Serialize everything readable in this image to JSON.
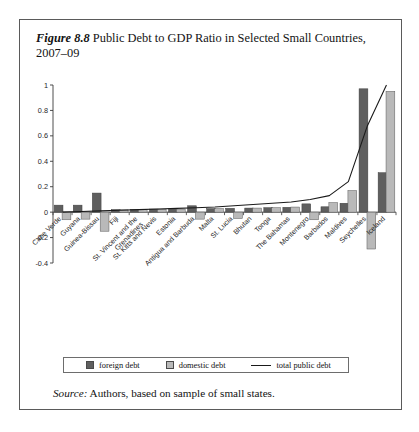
{
  "figure": {
    "number": "Figure 8.8",
    "title": " Public Debt to GDP Ratio in Selected Small Countries, 2007–09"
  },
  "source": {
    "label": "Source:",
    "text": " Authors, based on sample of small states."
  },
  "legend": {
    "position": "bottom-outside",
    "items": [
      {
        "label": "foreign debt",
        "type": "swatch",
        "color": "#5f5f5f"
      },
      {
        "label": "domestic debt",
        "type": "swatch",
        "color": "#b9b9b9"
      },
      {
        "label": "total public debt",
        "type": "line",
        "color": "#1a1a1a"
      }
    ]
  },
  "chart_data": {
    "type": "bar",
    "title": "Public Debt to GDP Ratio in Selected Small Countries, 2007–09",
    "subtitle": "",
    "xlabel": "",
    "ylabel": "",
    "ylim": [
      -0.4,
      1.0
    ],
    "yticks": [
      -0.4,
      -0.2,
      0,
      0.2,
      0.4,
      0.6,
      0.8,
      1
    ],
    "ytick_labels": [
      "-0.4",
      "-0.2",
      "0",
      "0.2",
      "0.4",
      "0.6",
      "0.8",
      "1"
    ],
    "grid": false,
    "categories": [
      "Cape Verde",
      "Guyana",
      "Guinea-Bissau",
      "Fiji",
      "St. Vincent and the Grenadines",
      "St. Kitts and Nevis",
      "Estonia",
      "Antigua and Barbuda",
      "Malta",
      "St. Lucia",
      "Bhutan",
      "Tonga",
      "The Bahamas",
      "Montenegro",
      "Barbados",
      "Maldives",
      "Seychelles",
      "Iceland"
    ],
    "series": [
      {
        "name": "foreign debt",
        "color": "#5f5f5f",
        "values": [
          0.055,
          0.055,
          0.15,
          0.02,
          0.022,
          0.024,
          0.026,
          0.05,
          0.028,
          0.03,
          0.032,
          0.035,
          0.038,
          0.065,
          0.042,
          0.07,
          0.97,
          0.31
        ]
      },
      {
        "name": "domestic debt",
        "color": "#b9b9b9",
        "values": [
          -0.06,
          -0.055,
          -0.15,
          0.018,
          0.02,
          0.022,
          0.024,
          -0.055,
          0.028,
          -0.05,
          0.032,
          0.035,
          0.04,
          -0.06,
          0.075,
          0.17,
          -0.29,
          0.95
        ]
      },
      {
        "name": "total public debt",
        "color": "#1a1a1a",
        "type": "line",
        "values": [
          0.0,
          0.005,
          0.01,
          0.015,
          0.02,
          0.025,
          0.03,
          0.035,
          0.04,
          0.05,
          0.06,
          0.07,
          0.08,
          0.1,
          0.13,
          0.24,
          0.68,
          1.26
        ]
      }
    ]
  }
}
